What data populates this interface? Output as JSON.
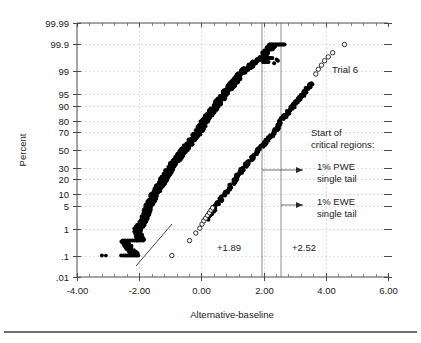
{
  "chart_data": {
    "type": "scatter",
    "title": "",
    "xlabel": "Alternative-baseline",
    "ylabel": "Percent",
    "xlim": [
      -4.0,
      6.0
    ],
    "xticks": [
      -4.0,
      -2.0,
      0.0,
      2.0,
      4.0,
      6.0
    ],
    "xtick_labels": [
      "-4.00",
      "-2.00",
      "0.00",
      "2.00",
      "4.00",
      "6.00"
    ],
    "x_minor_tick_step": 0.4,
    "yscale": "normal-probability",
    "ytick_labels": [
      "99.99",
      "99.9",
      "99",
      "95",
      "90",
      "80",
      "70",
      "50",
      "30",
      "20",
      "10",
      "5",
      "1",
      ".1",
      ".01"
    ],
    "ytick_values": [
      99.99,
      99.9,
      99,
      95,
      90,
      80,
      70,
      50,
      30,
      20,
      10,
      5,
      1,
      0.1,
      0.01
    ],
    "grid": true,
    "grid_style": "dashed-light",
    "legend_position": "none",
    "series": [
      {
        "name": "baseline-distribution",
        "marker": "filled-circle",
        "color": "#000000",
        "description": "Dense band of filled points running from about (-3.2, 0.1) up to (2.4, 99.9)",
        "anchor_points": [
          [
            -3.2,
            0.1
          ],
          [
            -2.55,
            0.1
          ],
          [
            -2.45,
            0.1
          ],
          [
            -2.38,
            0.1
          ],
          [
            -2.3,
            0.1
          ],
          [
            -2.2,
            0.1
          ],
          [
            -2.12,
            0.1
          ],
          [
            -2.5,
            0.4
          ],
          [
            -2.35,
            0.4
          ],
          [
            -2.22,
            0.4
          ],
          [
            -2.1,
            0.4
          ],
          [
            -1.95,
            0.4
          ],
          [
            -2.05,
            1.0
          ],
          [
            -1.85,
            2.0
          ],
          [
            -1.7,
            5.0
          ],
          [
            -1.5,
            10.0
          ],
          [
            -1.2,
            20.0
          ],
          [
            -1.0,
            30.0
          ],
          [
            -0.55,
            50.0
          ],
          [
            -0.1,
            70.0
          ],
          [
            0.1,
            80.0
          ],
          [
            0.45,
            90.0
          ],
          [
            0.75,
            95.0
          ],
          [
            1.35,
            99.0
          ],
          [
            1.75,
            99.5
          ],
          [
            2.0,
            99.7
          ],
          [
            2.1,
            99.8
          ],
          [
            2.3,
            99.9
          ],
          [
            2.55,
            99.9
          ]
        ]
      },
      {
        "name": "trial-6-alternative",
        "marker": "open-circle",
        "color": "#000000",
        "description": "Sparser band with open circles at the tails, from about (-0.95, 0.1) up to (4.6, 99.9)",
        "anchor_points": [
          [
            -0.95,
            0.1
          ],
          [
            -0.35,
            0.4
          ],
          [
            -0.15,
            0.7
          ],
          [
            -0.05,
            1.0
          ],
          [
            0.05,
            1.5
          ],
          [
            0.15,
            2.0
          ],
          [
            0.3,
            3.0
          ],
          [
            0.45,
            5.0
          ],
          [
            0.75,
            10.0
          ],
          [
            1.1,
            20.0
          ],
          [
            1.35,
            30.0
          ],
          [
            1.85,
            50.0
          ],
          [
            2.35,
            70.0
          ],
          [
            2.55,
            80.0
          ],
          [
            2.95,
            90.0
          ],
          [
            3.3,
            95.0
          ],
          [
            3.6,
            98.0
          ],
          [
            3.7,
            99.0
          ],
          [
            3.85,
            99.3
          ],
          [
            3.95,
            99.5
          ],
          [
            4.1,
            99.6
          ],
          [
            4.25,
            99.7
          ],
          [
            4.6,
            99.9
          ]
        ]
      }
    ],
    "reference_lines": [
      {
        "name": "pwe-critical",
        "x": 1.89,
        "label": "+1.89",
        "orientation": "vertical"
      },
      {
        "name": "ewe-critical",
        "x": 2.52,
        "label": "+2.52",
        "orientation": "vertical"
      }
    ],
    "annotations": [
      {
        "name": "trial-label",
        "text": "Trial 6"
      },
      {
        "name": "critical-heading-line1",
        "text": "Start of"
      },
      {
        "name": "critical-heading-line2",
        "text": "critical regions:"
      },
      {
        "name": "pwe-label-line1",
        "text": "1% PWE"
      },
      {
        "name": "pwe-label-line2",
        "text": "single tail"
      },
      {
        "name": "ewe-label-line1",
        "text": "1% EWE"
      },
      {
        "name": "ewe-label-line2",
        "text": "single tail"
      },
      {
        "name": "pwe-value",
        "text": "+1.89"
      },
      {
        "name": "ewe-value",
        "text": "+2.52"
      }
    ]
  },
  "axes": {
    "x_title": "Alternative-baseline",
    "y_title": "Percent",
    "x_tick_labels": [
      "-4.00",
      "-2.00",
      "0.00",
      "2.00",
      "4.00",
      "6.00"
    ],
    "y_tick_labels": [
      "99.99",
      "99.9",
      "99",
      "95",
      "90",
      "80",
      "70",
      "50",
      "30",
      "20",
      "10",
      "5",
      "1",
      ".1",
      ".01"
    ]
  },
  "annotations": {
    "trial": "Trial 6",
    "critical_heading_1": "Start of",
    "critical_heading_2": "critical regions:",
    "pwe_1": "1% PWE",
    "pwe_2": "single tail",
    "ewe_1": "1% EWE",
    "ewe_2": "single tail",
    "pwe_value": "+1.89",
    "ewe_value": "+2.52"
  },
  "colors": {
    "point": "#000000",
    "grid": "#c8c8cc",
    "frame": "#4a4a4a",
    "text": "#1a1a1a",
    "critical_line": "#6e6e74",
    "rule": "#3c3c46"
  }
}
